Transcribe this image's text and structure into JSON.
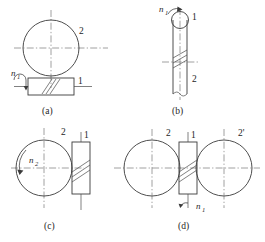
{
  "sheet": {
    "title": "Worm and worm-gear drive orientation diagrams",
    "background_color": "#ffffff",
    "line_color": "#3a3a3a",
    "centerline_color": "#6e6e6e"
  },
  "figures": [
    {
      "key": "a",
      "caption": "(a)",
      "description": "Worm below, worm wheel above shown as full circle; worm axis horizontal",
      "labels": {
        "wheel": "2",
        "worm": "1",
        "speed": "n",
        "speed_sub": "1"
      }
    },
    {
      "key": "b",
      "caption": "(b)",
      "description": "Vertical worm shaft with small circle at top end; worm wheel edge view",
      "labels": {
        "worm": "1",
        "wheel": "2",
        "speed": "n",
        "speed_sub": "1"
      }
    },
    {
      "key": "c",
      "caption": "(c)",
      "description": "Worm wheel at left as circle with rotation arrow, vertical worm at right",
      "labels": {
        "wheel": "2",
        "worm": "1",
        "speed": "n",
        "speed_sub": "2"
      }
    },
    {
      "key": "d",
      "caption": "(d)",
      "description": "Two worm wheels flanking a central vertical worm",
      "labels": {
        "wheel_left": "2",
        "wheel_right": "2'",
        "worm": "1",
        "speed": "n",
        "speed_sub": "1"
      }
    }
  ]
}
